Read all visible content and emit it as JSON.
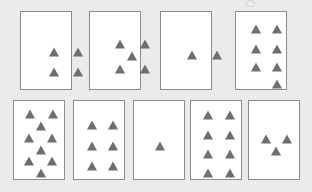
{
  "figure": {
    "title": "",
    "background_color": "#ebebeb",
    "card_fill_color": "#ffffff",
    "card_border_color": "#8c8c8c",
    "triangle_color": "#6e6e6e",
    "rows": 2,
    "total_cards": 9,
    "total_triangles": 45
  },
  "chart_data": {
    "type": "table",
    "title": "",
    "categories": [
      "Card 1",
      "Card 2",
      "Card 3",
      "Card 4",
      "Card 5",
      "Card 6",
      "Card 7",
      "Card 8",
      "Card 9"
    ],
    "values": [
      4,
      5,
      2,
      7,
      9,
      6,
      1,
      8,
      3
    ],
    "xlabel": "Card",
    "ylabel": "Triangle count"
  },
  "cards": [
    {
      "id": "card-1",
      "row": 1,
      "position": 1,
      "count": 4,
      "arrangement": "2x2 grid",
      "x": 20,
      "y": 11,
      "w": 52,
      "h": 79,
      "triangles": [
        {
          "x": 33,
          "y": 40
        },
        {
          "x": 57,
          "y": 40
        },
        {
          "x": 33,
          "y": 60
        },
        {
          "x": 57,
          "y": 60
        }
      ]
    },
    {
      "id": "card-2",
      "row": 1,
      "position": 2,
      "count": 5,
      "arrangement": "quincunx",
      "x": 89,
      "y": 11,
      "w": 52,
      "h": 79,
      "triangles": [
        {
          "x": 30,
          "y": 32
        },
        {
          "x": 55,
          "y": 32
        },
        {
          "x": 42,
          "y": 44
        },
        {
          "x": 30,
          "y": 57
        },
        {
          "x": 55,
          "y": 57
        }
      ]
    },
    {
      "id": "card-3",
      "row": 1,
      "position": 3,
      "count": 2,
      "arrangement": "horizontal pair",
      "x": 160,
      "y": 11,
      "w": 52,
      "h": 79,
      "triangles": [
        {
          "x": 31,
          "y": 43
        },
        {
          "x": 56,
          "y": 43
        }
      ]
    },
    {
      "id": "card-4",
      "row": 1,
      "position": 4,
      "count": 7,
      "arrangement": "3 rows of 2 plus 1 bottom right",
      "x": 235,
      "y": 11,
      "w": 52,
      "h": 79,
      "triangles": [
        {
          "x": 20,
          "y": 17
        },
        {
          "x": 41,
          "y": 17
        },
        {
          "x": 20,
          "y": 37
        },
        {
          "x": 41,
          "y": 37
        },
        {
          "x": 20,
          "y": 55
        },
        {
          "x": 41,
          "y": 55
        },
        {
          "x": 41,
          "y": 72
        }
      ]
    },
    {
      "id": "card-5",
      "row": 2,
      "position": 1,
      "count": 9,
      "arrangement": "staggered zigzag",
      "x": 13,
      "y": 100,
      "w": 52,
      "h": 80,
      "triangles": [
        {
          "x": 16,
          "y": 13
        },
        {
          "x": 39,
          "y": 13
        },
        {
          "x": 27,
          "y": 25
        },
        {
          "x": 15,
          "y": 37
        },
        {
          "x": 38,
          "y": 37
        },
        {
          "x": 27,
          "y": 49
        },
        {
          "x": 15,
          "y": 60
        },
        {
          "x": 38,
          "y": 60
        },
        {
          "x": 27,
          "y": 72
        }
      ]
    },
    {
      "id": "card-6",
      "row": 2,
      "position": 2,
      "count": 6,
      "arrangement": "3 rows of 2",
      "x": 73,
      "y": 100,
      "w": 52,
      "h": 80,
      "triangles": [
        {
          "x": 18,
          "y": 24
        },
        {
          "x": 39,
          "y": 24
        },
        {
          "x": 18,
          "y": 45
        },
        {
          "x": 39,
          "y": 45
        },
        {
          "x": 18,
          "y": 65
        },
        {
          "x": 39,
          "y": 65
        }
      ]
    },
    {
      "id": "card-7",
      "row": 2,
      "position": 3,
      "count": 1,
      "arrangement": "single centered",
      "x": 133,
      "y": 100,
      "w": 52,
      "h": 80,
      "triangles": [
        {
          "x": 26,
          "y": 45
        }
      ]
    },
    {
      "id": "card-8",
      "row": 2,
      "position": 4,
      "count": 8,
      "arrangement": "4 rows of 2",
      "x": 190,
      "y": 100,
      "w": 52,
      "h": 80,
      "triangles": [
        {
          "x": 17,
          "y": 14
        },
        {
          "x": 39,
          "y": 14
        },
        {
          "x": 17,
          "y": 34
        },
        {
          "x": 39,
          "y": 34
        },
        {
          "x": 17,
          "y": 53
        },
        {
          "x": 39,
          "y": 53
        },
        {
          "x": 17,
          "y": 72
        },
        {
          "x": 39,
          "y": 72
        }
      ]
    },
    {
      "id": "card-9",
      "row": 2,
      "position": 5,
      "count": 3,
      "arrangement": "triangular trio",
      "x": 248,
      "y": 100,
      "w": 52,
      "h": 80,
      "triangles": [
        {
          "x": 17,
          "y": 38
        },
        {
          "x": 38,
          "y": 38
        },
        {
          "x": 27,
          "y": 50
        }
      ]
    }
  ]
}
